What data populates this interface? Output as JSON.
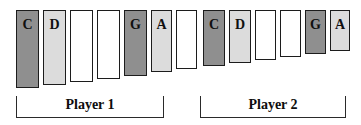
{
  "diagram": {
    "colors": {
      "dark_gray": "#8f8f8f",
      "light_gray": "#dcdcdc",
      "white": "#ffffff",
      "outline": "#1c1c1c",
      "bracket": "#2a2a2a",
      "text": "#101010",
      "background": "#ffffff"
    },
    "groups": [
      {
        "id": "player-1",
        "label": "Player 1",
        "bracket": {
          "x": 16,
          "y": 96,
          "width": 148
        },
        "bars": [
          {
            "label": "C",
            "fill": "dark_gray",
            "x": 16,
            "y": 10,
            "width": 23,
            "height": 78
          },
          {
            "label": "D",
            "fill": "light_gray",
            "x": 43,
            "y": 10,
            "width": 23,
            "height": 75
          },
          {
            "label": "",
            "fill": "white",
            "x": 70,
            "y": 10,
            "width": 23,
            "height": 72
          },
          {
            "label": "",
            "fill": "white",
            "x": 97,
            "y": 10,
            "width": 23,
            "height": 69
          },
          {
            "label": "G",
            "fill": "dark_gray",
            "x": 124,
            "y": 10,
            "width": 23,
            "height": 66
          },
          {
            "label": "A",
            "fill": "light_gray",
            "x": 151,
            "y": 10,
            "width": 21,
            "height": 62
          },
          {
            "label": "",
            "fill": "white",
            "x": 176,
            "y": 10,
            "width": 21,
            "height": 59
          }
        ]
      },
      {
        "id": "player-2",
        "label": "Player 2",
        "bracket": {
          "x": 200,
          "y": 96,
          "width": 146
        },
        "bars": [
          {
            "label": "C",
            "fill": "dark_gray",
            "x": 203,
            "y": 10,
            "width": 22,
            "height": 56
          },
          {
            "label": "D",
            "fill": "light_gray",
            "x": 229,
            "y": 10,
            "width": 22,
            "height": 53
          },
          {
            "label": "",
            "fill": "white",
            "x": 255,
            "y": 10,
            "width": 21,
            "height": 50
          },
          {
            "label": "",
            "fill": "white",
            "x": 280,
            "y": 10,
            "width": 21,
            "height": 47
          },
          {
            "label": "G",
            "fill": "dark_gray",
            "x": 305,
            "y": 10,
            "width": 21,
            "height": 44
          },
          {
            "label": "A",
            "fill": "light_gray",
            "x": 330,
            "y": 10,
            "width": 20,
            "height": 41
          }
        ]
      }
    ]
  }
}
